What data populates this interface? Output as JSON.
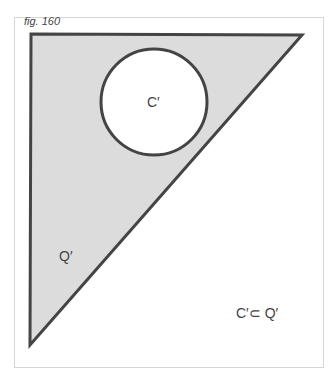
{
  "figure": {
    "label": "fig. 160",
    "shapes": {
      "triangle": {
        "label": "Q′",
        "points": [
          [
            31,
            34
          ],
          [
            302,
            35
          ],
          [
            30,
            345
          ]
        ],
        "fill": "#dcdcdc",
        "stroke": "#444444"
      },
      "circle": {
        "label": "C′",
        "cx": 154,
        "cy": 102,
        "r": 53,
        "fill": "#ffffff",
        "stroke": "#444444"
      }
    },
    "relation": "C′⊂ Q′"
  }
}
